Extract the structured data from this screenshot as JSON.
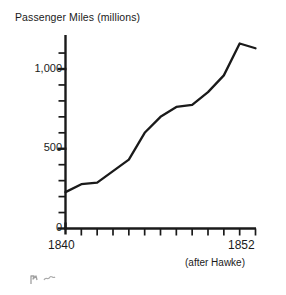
{
  "chart_data": {
    "type": "line",
    "title": "Passenger Miles (millions)",
    "xlabel": "",
    "ylabel": "Passenger Miles (millions)",
    "source_note": "(after Hawke)",
    "x_start_label": "1840",
    "x_end_label": "1852",
    "xlim": [
      1840,
      1852
    ],
    "ylim": [
      0,
      1200
    ],
    "y_tick_labels": [
      "0",
      "500",
      "1,000"
    ],
    "y_labeled_values": [
      0,
      500,
      1000
    ],
    "y_minor_tick_interval": 100,
    "x_tick_interval": 1,
    "grid": false,
    "legend": null,
    "line_color": "#1a1a1a",
    "axis_color": "#1a1a1a",
    "x": [
      1840,
      1841,
      1842,
      1843,
      1844,
      1845,
      1846,
      1847,
      1848,
      1849,
      1850,
      1851,
      1852
    ],
    "values": [
      228,
      278,
      288,
      360,
      432,
      600,
      700,
      762,
      775,
      855,
      960,
      1160,
      1130
    ],
    "series": [
      {
        "name": "Passenger Miles",
        "values": [
          228,
          278,
          288,
          360,
          432,
          600,
          700,
          762,
          775,
          855,
          960,
          1160,
          1130
        ]
      }
    ]
  },
  "figure": {
    "title": "Passenger Miles (millions)",
    "y_axis": {
      "label_1000": "1,000",
      "label_500": "500",
      "label_0": "0"
    },
    "x_axis": {
      "label_start": "1840",
      "label_end": "1852"
    },
    "annotation": "(after Hawke)"
  }
}
